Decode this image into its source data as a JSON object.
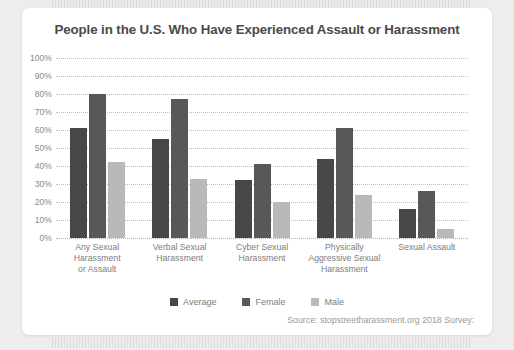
{
  "chart_data": {
    "type": "bar",
    "title": "People in the U.S. Who Have Experienced Assault or Harassment",
    "xlabel": "",
    "ylabel": "",
    "ylim": [
      0,
      100
    ],
    "ytick_labels": [
      "100%",
      "90%",
      "80%",
      "70%",
      "60%",
      "50%",
      "40%",
      "30%",
      "20%",
      "10%",
      "0%"
    ],
    "ytick_values": [
      100,
      90,
      80,
      70,
      60,
      50,
      40,
      30,
      20,
      10,
      0
    ],
    "grid": true,
    "legend_position": "bottom-center",
    "categories": [
      "Any Sexual\nHarassment\nor Assault",
      "Verbal Sexual\nHarassment",
      "Cyber Sexual\nHarassment",
      "Physically\nAggressive Sexual\nHarassment",
      "Sexual Assault"
    ],
    "series": [
      {
        "name": "Average",
        "color": "#474747",
        "values": [
          61,
          55,
          32,
          44,
          16
        ]
      },
      {
        "name": "Female",
        "color": "#585858",
        "values": [
          80,
          77,
          41,
          61,
          26
        ]
      },
      {
        "name": "Male",
        "color": "#b9b9b9",
        "values": [
          42,
          33,
          20,
          24,
          5
        ]
      }
    ],
    "annotations": [
      "Source: stopstreetharassment.org 2018 Survey:"
    ]
  },
  "source_note": "Source: stopstreetharassment.org 2018 Survey:"
}
